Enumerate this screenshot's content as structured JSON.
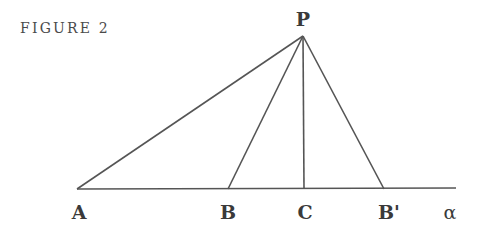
{
  "figure": {
    "caption": "FIGURE 2",
    "stroke_color": "#555555",
    "label_color": "#3a3a3a"
  },
  "points": {
    "P": {
      "label": "P",
      "x": 303,
      "y": 36
    },
    "A": {
      "label": "A",
      "x": 77,
      "y": 189
    },
    "B": {
      "label": "B",
      "x": 228,
      "y": 189
    },
    "C": {
      "label": "C",
      "x": 304,
      "y": 189
    },
    "Bp": {
      "label": "B'",
      "x": 384,
      "y": 189
    }
  },
  "line": {
    "label": "α",
    "x_start": 77,
    "x_end": 456,
    "y": 189
  },
  "segments": [
    {
      "from": "P",
      "to": "A"
    },
    {
      "from": "P",
      "to": "B"
    },
    {
      "from": "P",
      "to": "C"
    },
    {
      "from": "P",
      "to": "Bp"
    }
  ]
}
